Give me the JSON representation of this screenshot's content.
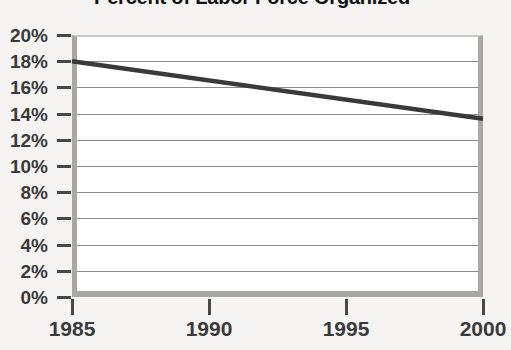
{
  "chart_data": {
    "type": "line",
    "title": "Percent of Labor Force Organized",
    "xlabel": "",
    "ylabel": "",
    "x": [
      1985,
      2000
    ],
    "series": [
      {
        "name": "Percent of Labor Force Organized",
        "values": [
          18.0,
          13.6
        ],
        "color": "#3a3a3a"
      }
    ],
    "xticks": [
      1985,
      1990,
      1995,
      2000
    ],
    "xtick_labels": [
      "1985",
      "1990",
      "1995",
      "2000"
    ],
    "xlim": [
      1985,
      2000
    ],
    "yticks": [
      0,
      2,
      4,
      6,
      8,
      10,
      12,
      14,
      16,
      18,
      20
    ],
    "ytick_labels": [
      "0%",
      "2%",
      "4%",
      "6%",
      "8%",
      "10%",
      "12%",
      "14%",
      "16%",
      "18%",
      "20%"
    ],
    "ylim": [
      0,
      20
    ],
    "grid": true,
    "legend": false,
    "annotations": []
  },
  "colors": {
    "background": "#f5f4f2",
    "plot_background": "#ffffff",
    "frame": "#a9a7a3",
    "gridline": "#8d8b88",
    "line": "#3a3a3a",
    "label_text": "#3a3a3a",
    "title_text": "#111111"
  }
}
